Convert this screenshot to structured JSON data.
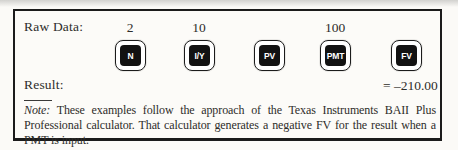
{
  "figure": {
    "raw_data_label": "Raw Data:",
    "result_label": "Result:",
    "result_value": "= –210.00",
    "keys": [
      {
        "label": "N",
        "value": "2"
      },
      {
        "label": "I/Y",
        "value": "10"
      },
      {
        "label": "PV",
        "value": ""
      },
      {
        "label": "PMT",
        "value": "100"
      },
      {
        "label": "FV",
        "value": ""
      }
    ],
    "note": {
      "prefix": "Note:",
      "text": "These examples follow the approach of the Texas Instruments BAII Plus Professional calculator. That calculator generates a negative FV for the result when a PMT is input."
    },
    "colors": {
      "key_fill": "#121212",
      "key_text": "#ffffff",
      "box_border": "#1b1b1b",
      "text": "#2e2d2a",
      "paper": "#fbfaf7"
    }
  }
}
